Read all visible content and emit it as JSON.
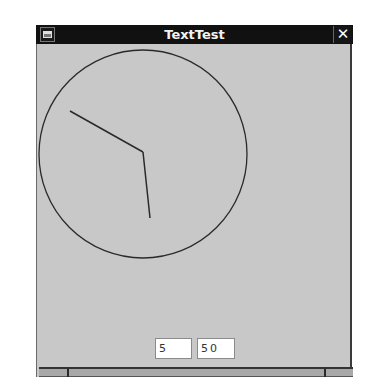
{
  "window": {
    "title": "TextTest",
    "menu_icon": "window-menu-icon",
    "close_label": "✕"
  },
  "clock": {
    "circle": {
      "cx": 106,
      "cy": 110,
      "r": 104
    },
    "hands": [
      {
        "name": "hour-hand",
        "x2": 33,
        "y2": 67
      },
      {
        "name": "minute-hand",
        "x2": 113,
        "y2": 174
      }
    ],
    "center": {
      "x": 106,
      "y": 108
    },
    "stroke": "#2a2a2a"
  },
  "inputs": {
    "hours_value": "5",
    "minutes_value": "50"
  },
  "colors": {
    "titlebar": "#111111",
    "background": "#c8c8c8"
  }
}
